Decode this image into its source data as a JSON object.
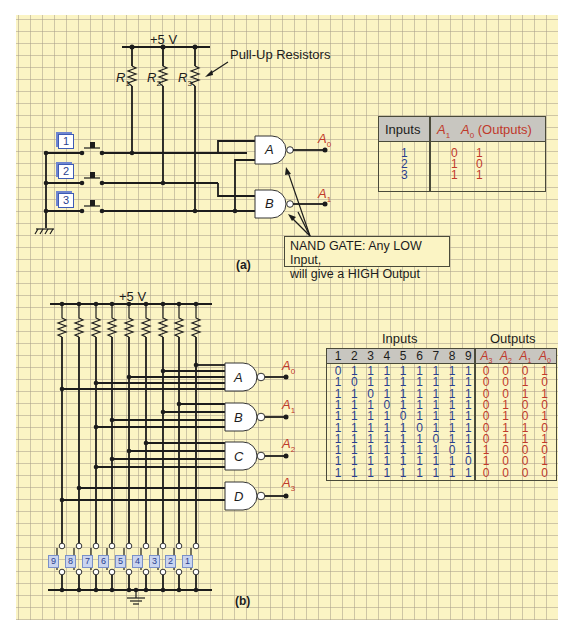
{
  "figure_a": {
    "supply_label": "+5 V",
    "resistors": [
      "R1",
      "R2",
      "R3"
    ],
    "resistor_labels": [
      {
        "main": "R",
        "sub": "1"
      },
      {
        "main": "R",
        "sub": "2"
      },
      {
        "main": "R",
        "sub": "3"
      }
    ],
    "pull_up_label": "Pull-Up Resistors",
    "switch_keys": [
      "1",
      "2",
      "3"
    ],
    "gates": [
      {
        "name": "A",
        "output": {
          "main": "A",
          "sub": "0"
        }
      },
      {
        "name": "B",
        "output": {
          "main": "A",
          "sub": "1"
        }
      }
    ],
    "note_line1": "NAND GATE: Any LOW Input,",
    "note_line2": "will give a HIGH Output",
    "caption": "(a)",
    "table": {
      "header_inputs": "Inputs",
      "header_outputs": "A1  A0 (Outputs)",
      "header_outputs_parts": {
        "a1": "A",
        "a1_sub": "1",
        "a0": "A",
        "a0_sub": "0",
        "suffix": "(Outputs)"
      },
      "rows": [
        {
          "input": "1",
          "A1": "0",
          "A0": "1"
        },
        {
          "input": "2",
          "A1": "1",
          "A0": "0"
        },
        {
          "input": "3",
          "A1": "1",
          "A0": "1"
        }
      ]
    }
  },
  "figure_b": {
    "supply_label": "+5 V",
    "gates": [
      {
        "name": "A",
        "output": {
          "main": "A",
          "sub": "0"
        }
      },
      {
        "name": "B",
        "output": {
          "main": "A",
          "sub": "1"
        }
      },
      {
        "name": "C",
        "output": {
          "main": "A",
          "sub": "2"
        }
      },
      {
        "name": "D",
        "output": {
          "main": "A",
          "sub": "3"
        }
      }
    ],
    "switch_keys": [
      "9",
      "8",
      "7",
      "6",
      "5",
      "4",
      "3",
      "2",
      "1"
    ],
    "caption": "(b)",
    "table": {
      "group_inputs": "Inputs",
      "group_outputs": "Outputs",
      "input_headers": [
        "1",
        "2",
        "3",
        "4",
        "5",
        "6",
        "7",
        "8",
        "9"
      ],
      "output_headers": [
        {
          "main": "A",
          "sub": "3"
        },
        {
          "main": "A",
          "sub": "2"
        },
        {
          "main": "A",
          "sub": "1"
        },
        {
          "main": "A",
          "sub": "0"
        }
      ],
      "rows": [
        {
          "inputs": [
            "0",
            "1",
            "1",
            "1",
            "1",
            "1",
            "1",
            "1",
            "1"
          ],
          "outputs": [
            "0",
            "0",
            "0",
            "1"
          ]
        },
        {
          "inputs": [
            "1",
            "0",
            "1",
            "1",
            "1",
            "1",
            "1",
            "1",
            "1"
          ],
          "outputs": [
            "0",
            "0",
            "1",
            "0"
          ]
        },
        {
          "inputs": [
            "1",
            "1",
            "0",
            "1",
            "1",
            "1",
            "1",
            "1",
            "1"
          ],
          "outputs": [
            "0",
            "0",
            "1",
            "1"
          ]
        },
        {
          "inputs": [
            "1",
            "1",
            "1",
            "0",
            "1",
            "1",
            "1",
            "1",
            "1"
          ],
          "outputs": [
            "0",
            "1",
            "0",
            "0"
          ]
        },
        {
          "inputs": [
            "1",
            "1",
            "1",
            "1",
            "0",
            "1",
            "1",
            "1",
            "1"
          ],
          "outputs": [
            "0",
            "1",
            "0",
            "1"
          ]
        },
        {
          "inputs": [
            "1",
            "1",
            "1",
            "1",
            "1",
            "0",
            "1",
            "1",
            "1"
          ],
          "outputs": [
            "0",
            "1",
            "1",
            "0"
          ]
        },
        {
          "inputs": [
            "1",
            "1",
            "1",
            "1",
            "1",
            "1",
            "0",
            "1",
            "1"
          ],
          "outputs": [
            "0",
            "1",
            "1",
            "1"
          ]
        },
        {
          "inputs": [
            "1",
            "1",
            "1",
            "1",
            "1",
            "1",
            "1",
            "0",
            "1"
          ],
          "outputs": [
            "1",
            "0",
            "0",
            "0"
          ]
        },
        {
          "inputs": [
            "1",
            "1",
            "1",
            "1",
            "1",
            "1",
            "1",
            "1",
            "0"
          ],
          "outputs": [
            "1",
            "0",
            "0",
            "1"
          ]
        },
        {
          "inputs": [
            "1",
            "1",
            "1",
            "1",
            "1",
            "1",
            "1",
            "1",
            "1"
          ],
          "outputs": [
            "0",
            "0",
            "0",
            "0"
          ]
        }
      ]
    }
  },
  "colors": {
    "paper": "#fbf4c4",
    "grid": "#aaa08c",
    "wire": "#1c1c1c",
    "output_red": "#c0392b",
    "input_blue": "#2a3f8f",
    "table_header": "#c8c6c0"
  }
}
